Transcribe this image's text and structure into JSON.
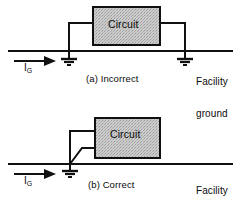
{
  "figure": {
    "colors": {
      "line": "#111111",
      "box_fill": "#c9c9c9",
      "box_stroke": "#101010",
      "background": "#ffffff"
    }
  },
  "panels": [
    {
      "id": "panel-a",
      "caption": "(a) Incorrect",
      "box_label": "Circuit",
      "current_label": "I",
      "current_subscript": "G",
      "bus_label_line1": "Facility",
      "bus_label_line2": "ground",
      "ground_symbol_count": 2
    },
    {
      "id": "panel-b",
      "caption": "(b) Correct",
      "box_label": "Circuit",
      "current_label": "I",
      "current_subscript": "G",
      "bus_label_line1": "Facility",
      "bus_label_line2": "ground",
      "ground_symbol_count": 1
    }
  ]
}
